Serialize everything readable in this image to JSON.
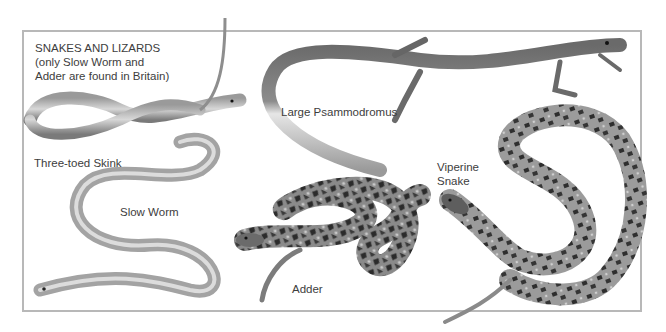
{
  "plate": {
    "title_lines": [
      "SNAKES AND LIZARDS",
      "(only Slow Worm and",
      "Adder are found in Britain)"
    ]
  },
  "species": [
    {
      "id": "three-toed-skink",
      "label": "Three-toed Skink"
    },
    {
      "id": "slow-worm",
      "label": "Slow Worm"
    },
    {
      "id": "large-psammodromus",
      "label": "Large Psammodromus"
    },
    {
      "id": "adder",
      "label": "Adder"
    },
    {
      "id": "viperine-snake",
      "label_lines": [
        "Viperine",
        "Snake"
      ]
    }
  ],
  "colors": {
    "frame": "#b8b8b8",
    "text": "#3d3d3d",
    "body_light": "#b9b9b9",
    "body_dark": "#5a5a5a",
    "blotch": "#2e2e2e"
  }
}
